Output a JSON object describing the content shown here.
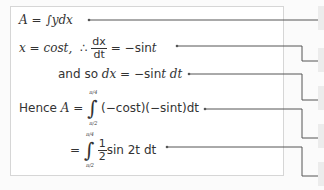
{
  "equations": [
    {
      "id": "eq1",
      "parts": {
        "lhs": "A",
        "eq": "=",
        "int": "∫",
        "rhs": "ydx"
      }
    },
    {
      "id": "eq2",
      "parts": {
        "x": "x",
        "eq1": "=",
        "cos": "cost,",
        "therefore": "∴",
        "num": "dx",
        "den": "dt",
        "eq2": "=",
        "rhs": "−sin",
        "t": "t"
      }
    },
    {
      "id": "eq3",
      "parts": {
        "lead": "and so",
        "dx": "dx",
        "eq": "=",
        "rhs": "−sin",
        "tdt": "t dt"
      }
    },
    {
      "id": "eq4",
      "parts": {
        "lead": "Hence",
        "A": "A",
        "eq": "=",
        "upper": "π/4",
        "lower": "π/2",
        "body": "(−cost)(−sint)dt"
      }
    },
    {
      "id": "eq5",
      "parts": {
        "eq": "=",
        "upper": "π/4",
        "lower": "π/2",
        "num": "1",
        "den": "2",
        "body": "sin 2t dt"
      }
    }
  ],
  "colors": {
    "line": "#555555",
    "border": "#d6d6d6",
    "tab": "#ececec"
  }
}
